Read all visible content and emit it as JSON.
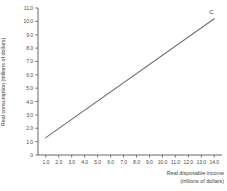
{
  "chart_data": {
    "type": "line",
    "title": "",
    "xlabel": "Real disposable income (trillions of dollars)",
    "xlabel_line1": "Real disposable income",
    "xlabel_line2": "(trillions of dollars)",
    "ylabel": "Real consumption (trillions of dollars)",
    "xlim": [
      0.4,
      14.6
    ],
    "ylim": [
      0,
      11.0
    ],
    "grid": false,
    "legend": "none",
    "xticks": [
      "1.0",
      "2.0",
      "3.0",
      "4.0",
      "5.0",
      "6.0",
      "7.0",
      "8.0",
      "9.0",
      "10.0",
      "11.0",
      "12.0",
      "13.0",
      "14.0"
    ],
    "xtick_values": [
      1.0,
      2.0,
      3.0,
      4.0,
      5.0,
      6.0,
      7.0,
      8.0,
      9.0,
      10.0,
      11.0,
      12.0,
      13.0,
      14.0
    ],
    "yticks": [
      "0",
      "1.0",
      "2.0",
      "3.0",
      "4.0",
      "5.0",
      "6.0",
      "7.0",
      "8.0",
      "9.0",
      "10.0",
      "11.0"
    ],
    "ytick_values": [
      0,
      1.0,
      2.0,
      3.0,
      4.0,
      5.0,
      6.0,
      7.0,
      8.0,
      9.0,
      10.0,
      11.0
    ],
    "series": [
      {
        "name": "C",
        "label": "C",
        "color": "#6f6f6f",
        "x": [
          1.0,
          14.0
        ],
        "values": [
          1.3,
          10.2
        ],
        "slope": 0.685,
        "intercept": 0.615
      }
    ],
    "annotations": [
      {
        "text": "C",
        "x": 14.0,
        "y": 10.6
      }
    ]
  },
  "axis": {
    "line_color": "#555555",
    "tick_color": "#555555"
  }
}
